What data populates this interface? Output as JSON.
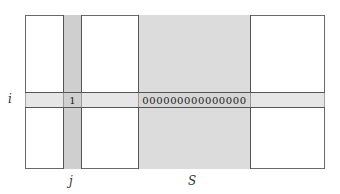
{
  "diagram": {
    "row_label": "i",
    "column_label": "j",
    "set_label": "S",
    "intersection_value": "1",
    "set_row_values": "000000000000000",
    "colors": {
      "border": "#6a6a6a",
      "column_j_fill": "#cfcfcf",
      "set_s_fill": "#dcdcdc",
      "row_i_fill": "#e0e0e0"
    }
  }
}
